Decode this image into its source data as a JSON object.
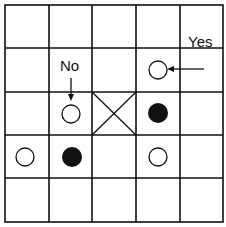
{
  "diagram": {
    "type": "game-board-grid",
    "rows": 5,
    "cols": 5,
    "colors": {
      "line": "#111111",
      "background": "#ffffff",
      "black_stone": "#111111",
      "white_stone": "#ffffff"
    },
    "pieces": [
      {
        "row": 1,
        "col": 3,
        "kind": "white"
      },
      {
        "row": 2,
        "col": 1,
        "kind": "white"
      },
      {
        "row": 2,
        "col": 3,
        "kind": "black"
      },
      {
        "row": 3,
        "col": 0,
        "kind": "white"
      },
      {
        "row": 3,
        "col": 1,
        "kind": "black"
      },
      {
        "row": 3,
        "col": 3,
        "kind": "white"
      }
    ],
    "crossed_cell": {
      "row": 2,
      "col": 2
    },
    "labels": {
      "no": "No",
      "yes": "Yes"
    },
    "arrows": [
      {
        "label": "No",
        "points_to": {
          "row": 2,
          "col": 1
        },
        "direction": "down"
      },
      {
        "label": "Yes",
        "points_to": {
          "row": 1,
          "col": 3
        },
        "direction": "left"
      }
    ]
  }
}
